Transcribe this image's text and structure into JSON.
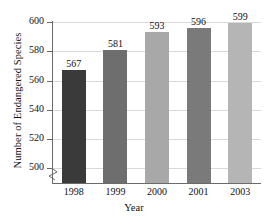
{
  "chart_data": {
    "type": "bar",
    "title": "",
    "categories": [
      "1998",
      "1999",
      "2000",
      "2001",
      "2003"
    ],
    "values": [
      567,
      581,
      593,
      596,
      599
    ],
    "value_labels": [
      "567",
      "581",
      "593",
      "596",
      "599"
    ],
    "xlabel": "Year",
    "ylabel": "Number of Endangered Species",
    "ylim": [
      490,
      600
    ],
    "yticks": [
      500,
      520,
      540,
      560,
      580,
      600
    ],
    "ytick_labels": [
      "500",
      "520",
      "540",
      "560",
      "580",
      "600"
    ],
    "grid": true,
    "axis_break": true,
    "legend": "none",
    "bar_colors": [
      "#3a3a3a",
      "#6e6e6e",
      "#a8a8a8",
      "#7a7a7a",
      "#b5b5b5"
    ],
    "background_color": "#ffffff",
    "axis_color": "#6a6a6a",
    "gridline_color": "#d9d9d9"
  }
}
